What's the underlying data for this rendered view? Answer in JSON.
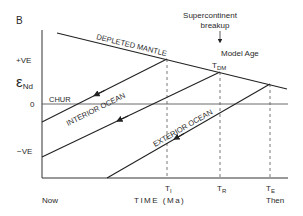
{
  "panel_label": "B",
  "y_axis": {
    "symbol": "ε",
    "subscript": "Nd",
    "ticks": [
      "+VE",
      "0",
      "−VE"
    ]
  },
  "x_axis": {
    "title": "TIME (Ma)",
    "left_label": "Now",
    "right_label": "Then",
    "ticks": [
      {
        "main": "T",
        "sub": "I"
      },
      {
        "main": "T",
        "sub": "R"
      },
      {
        "main": "T",
        "sub": "E"
      }
    ]
  },
  "lines": {
    "depleted_mantle": "DEPLETED MANTLE",
    "chur": "CHUR",
    "interior_ocean": "INTERIOR OCEAN",
    "exterior_ocean": "EXTERIOR OCEAN"
  },
  "annotations": {
    "supercontinent_line1": "Supercontinent",
    "supercontinent_line2": "breakup",
    "model_age": "Model Age",
    "tdm_main": "T",
    "tdm_sub": "DM"
  },
  "colors": {
    "line": "#222222",
    "dashed": "#555555",
    "background": "#ffffff"
  }
}
